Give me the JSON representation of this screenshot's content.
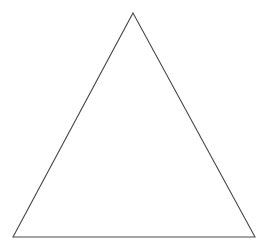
{
  "canvas": {
    "width": 271,
    "height": 251,
    "background_color": "#ffffff",
    "has_border": false,
    "has_text": false
  },
  "figure": {
    "name": "triangle",
    "shape_type": "triangle",
    "filled": false,
    "fill_color": "none",
    "stroke_color": "#4a4a4a",
    "stroke_width": 1.1,
    "vertices": [
      {
        "label": "apex",
        "x": 133,
        "y": 13
      },
      {
        "label": "bottom-right",
        "x": 255,
        "y": 237
      },
      {
        "label": "bottom-left",
        "x": 13,
        "y": 237
      }
    ],
    "points_attr": "133,13 255,237 13,237"
  }
}
